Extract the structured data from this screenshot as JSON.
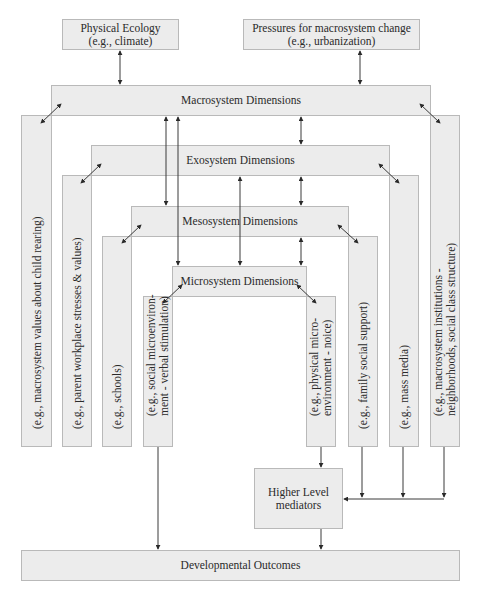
{
  "diagram": {
    "top_inputs": [
      {
        "id": "physical-ecology",
        "line1": "Physical Ecology",
        "line2": "(e.g., climate)"
      },
      {
        "id": "pressures",
        "line1": "Pressures for macrosystem change",
        "line2": "(e.g., urbanization)"
      }
    ],
    "levels": {
      "macro": "Macrosystem Dimensions",
      "exo": "Exosystem Dimensions",
      "meso": "Mesosystem Dimensions",
      "micro": "Microsystem Dimensions"
    },
    "columns": {
      "macro_left": [
        "(e.g., macrosystem values about child rearing)"
      ],
      "exo_left": [
        "(e.g., parent workplace stresses & values)"
      ],
      "meso_left": [
        "(e.g., schools)"
      ],
      "micro_left": [
        "(e.g., social microenviron-",
        "ment - verbal stimulation)"
      ],
      "micro_right": [
        "(e.g., physical micro-",
        "environment - noice)"
      ],
      "meso_right": [
        "(e.g., family social support)"
      ],
      "exo_right": [
        "(e.g., mass media)"
      ],
      "macro_right": [
        "(e.g., macrosystem institutions -",
        "neighborhoods, social class structure)"
      ]
    },
    "mediators": {
      "line1": "Higher Level",
      "line2": "mediators"
    },
    "outcomes": "Developmental Outcomes"
  }
}
